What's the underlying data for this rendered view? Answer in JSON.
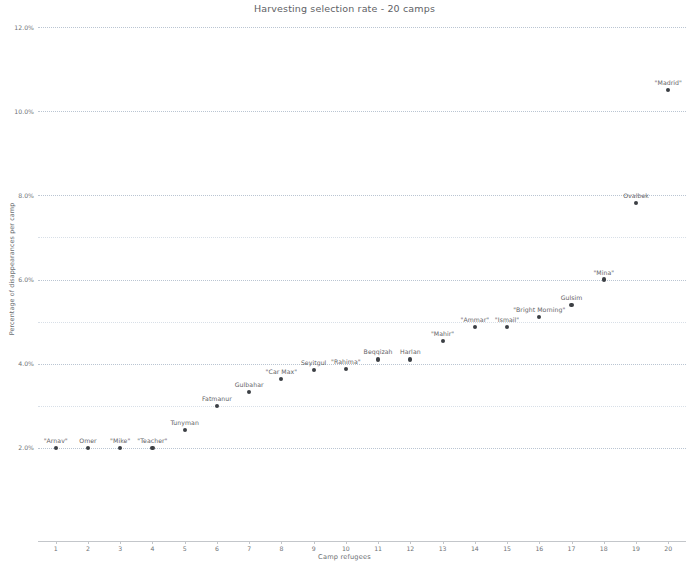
{
  "chart_data": {
    "type": "scatter",
    "title": "Harvesting selection rate - 20 camps",
    "xlabel": "Camp refugees",
    "ylabel": "Percentage of disappearances per camp",
    "xlim": [
      0.45,
      20.55
    ],
    "ylim": [
      0.0,
      12.0
    ],
    "grid": true,
    "legend": "none",
    "x_ticks": [
      "1",
      "2",
      "3",
      "4",
      "5",
      "6",
      "7",
      "8",
      "9",
      "10",
      "11",
      "12",
      "13",
      "14",
      "15",
      "16",
      "17",
      "18",
      "19",
      "20"
    ],
    "x_tick_values": [
      1,
      2,
      3,
      4,
      5,
      6,
      7,
      8,
      9,
      10,
      11,
      12,
      13,
      14,
      15,
      16,
      17,
      18,
      19,
      20
    ],
    "y_ticks": [
      "2.0%",
      "4.0%",
      "6.0%",
      "8.0%",
      "10.0%",
      "12.0%"
    ],
    "y_tick_values": [
      2.0,
      4.0,
      6.0,
      8.0,
      10.0,
      12.0
    ],
    "y_minor_gridlines": [
      3.0,
      5.0,
      7.0
    ],
    "point_label_position": "above",
    "x": [
      1,
      2,
      3,
      4,
      5,
      6,
      7,
      8,
      9,
      10,
      11,
      12,
      13,
      14,
      15,
      16,
      17,
      18,
      19,
      20
    ],
    "y": [
      2.0,
      2.0,
      2.0,
      2.0,
      2.42,
      3.0,
      3.32,
      3.63,
      3.85,
      3.88,
      4.1,
      4.1,
      4.53,
      4.88,
      4.88,
      5.1,
      5.4,
      6.0,
      7.82,
      10.5
    ],
    "values": [
      2.0,
      2.0,
      2.0,
      2.0,
      2.42,
      3.0,
      3.32,
      3.63,
      3.85,
      3.88,
      4.1,
      4.1,
      4.53,
      4.88,
      4.88,
      5.1,
      5.4,
      6.0,
      7.82,
      10.5
    ],
    "point_labels": [
      "\"Arnav\"",
      "Omer",
      "\"Mike\"",
      "\"Teacher\"",
      "",
      "Tunyman",
      "Fatmanur",
      "Gulbahar",
      "\"Car Max\"",
      "Seyitgul",
      "\"Rahima\"",
      "Beqqizah",
      "Harlan",
      "\"Mahir\"",
      "\"Ammar\"",
      "\"Ismail\"",
      "\"Bright Morning\"",
      "Gulsim",
      "\"Mina\"",
      "Ovalbek"
    ],
    "labeled_points": [
      {
        "x": 1,
        "y": 2.0,
        "label": "\"Arnav\""
      },
      {
        "x": 2,
        "y": 2.0,
        "label": "Omer"
      },
      {
        "x": 3,
        "y": 2.0,
        "label": "\"Mike\""
      },
      {
        "x": 4,
        "y": 2.0,
        "label": "\"Teacher\""
      },
      {
        "x": 5,
        "y": 2.42,
        "label": "Tunyman"
      },
      {
        "x": 6,
        "y": 3.0,
        "label": "Fatmanur"
      },
      {
        "x": 7,
        "y": 3.32,
        "label": "Gulbahar"
      },
      {
        "x": 8,
        "y": 3.63,
        "label": "\"Car Max\""
      },
      {
        "x": 9,
        "y": 3.85,
        "label": "Seyitgul"
      },
      {
        "x": 10,
        "y": 3.88,
        "label": "\"Rahima\""
      },
      {
        "x": 11,
        "y": 4.1,
        "label": "Beqqizah"
      },
      {
        "x": 12,
        "y": 4.1,
        "label": "Harlan"
      },
      {
        "x": 13,
        "y": 4.53,
        "label": "\"Mahir\""
      },
      {
        "x": 14,
        "y": 4.88,
        "label": "\"Ammar\""
      },
      {
        "x": 15,
        "y": 4.88,
        "label": "\"Ismail\""
      },
      {
        "x": 16,
        "y": 5.1,
        "label": "\"Bright Morning\""
      },
      {
        "x": 17,
        "y": 5.4,
        "label": "Gulsim"
      },
      {
        "x": 18,
        "y": 6.0,
        "label": "\"Mina\""
      },
      {
        "x": 19,
        "y": 7.82,
        "label": "Ovalbek"
      },
      {
        "x": 20,
        "y": 10.5,
        "label": "\"Madrid\""
      }
    ],
    "marker_color": "#3b3f44",
    "grid_color": "#b9c6d4",
    "text_color": "#5f6266"
  }
}
